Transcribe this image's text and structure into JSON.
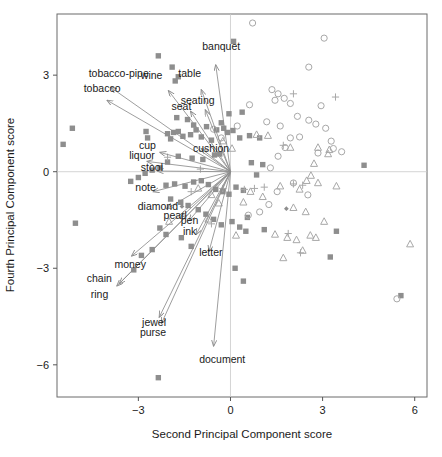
{
  "chart_data": {
    "type": "scatter",
    "title": "",
    "subtitle": "",
    "xlabel": "Second Principal Component score",
    "ylabel": "Fourth Principal Component score",
    "xlim": [
      -5.65,
      6.4
    ],
    "ylim": [
      -7.0,
      4.9
    ],
    "xticks": [
      -3,
      0,
      3,
      6
    ],
    "xticklabels": [
      "−3",
      "0",
      "3",
      "6"
    ],
    "yticks": [
      3,
      0,
      -3,
      -6
    ],
    "yticklabels": [
      "3",
      "0",
      "−3",
      "−6"
    ],
    "grid": false,
    "reference_lines": {
      "vertical_x": 0,
      "horizontal_y": 0,
      "color": "#c9c9c9"
    },
    "legend": {
      "visible": false,
      "position": "none"
    },
    "colors": {
      "square_fill": "#8e8e8e",
      "circle_stroke": "#a8a8a8",
      "triangle_stroke": "#a8a8a8",
      "plus_stroke": "#a8a8a8",
      "arrow": "#8c8c8c",
      "axis": "#555555",
      "text": "#1a1a1a",
      "frame": "#6b6b6b"
    },
    "marker_groups": [
      {
        "name": "filled-square",
        "symbol": "square",
        "filled": true,
        "points": [
          [
            -2.35,
            3.6
          ],
          [
            -1.9,
            3.25
          ],
          [
            -1.7,
            2.95
          ],
          [
            -1.8,
            2.82
          ],
          [
            -5.15,
            1.35
          ],
          [
            -5.45,
            0.85
          ],
          [
            -2.75,
            1.25
          ],
          [
            -2.7,
            1.05
          ],
          [
            -2.05,
            1.18
          ],
          [
            -1.85,
            1.22
          ],
          [
            -1.7,
            1.25
          ],
          [
            -1.95,
            1.02
          ],
          [
            -1.55,
            1.1
          ],
          [
            -1.3,
            1.15
          ],
          [
            -1.12,
            1.3
          ],
          [
            -0.95,
            1.08
          ],
          [
            -1.75,
            1.68
          ],
          [
            -1.4,
            1.62
          ],
          [
            -1.2,
            1.45
          ],
          [
            -0.78,
            1.4
          ],
          [
            -0.45,
            1.3
          ],
          [
            -0.3,
            1.52
          ],
          [
            -0.22,
            1.35
          ],
          [
            -0.1,
            1.22
          ],
          [
            0.08,
            1.28
          ],
          [
            0.3,
            1.05
          ],
          [
            0.62,
            1.12
          ],
          [
            0.95,
            1.05
          ],
          [
            -0.05,
            1.8
          ],
          [
            0.38,
            1.85
          ],
          [
            0.1,
            4.05
          ],
          [
            -0.52,
            0.52
          ],
          [
            -0.35,
            0.55
          ],
          [
            -0.9,
            0.38
          ],
          [
            -1.25,
            0.42
          ],
          [
            -1.7,
            0.48
          ],
          [
            -2.05,
            0.3
          ],
          [
            -2.3,
            0.12
          ],
          [
            -2.55,
            0.05
          ],
          [
            -2.78,
            -0.05
          ],
          [
            -3.0,
            -0.18
          ],
          [
            -3.25,
            -0.3
          ],
          [
            -2.1,
            -0.42
          ],
          [
            -1.82,
            -0.38
          ],
          [
            -1.48,
            -0.45
          ],
          [
            -1.2,
            -0.32
          ],
          [
            -0.95,
            -0.28
          ],
          [
            -0.72,
            -0.4
          ],
          [
            -0.48,
            -0.55
          ],
          [
            -0.25,
            -0.62
          ],
          [
            -0.05,
            -0.7
          ],
          [
            0.18,
            -0.48
          ],
          [
            0.42,
            -0.58
          ],
          [
            0.68,
            0.28
          ],
          [
            1.05,
            0.22
          ],
          [
            0.85,
            -0.1
          ],
          [
            -1.95,
            -0.85
          ],
          [
            -1.62,
            -0.95
          ],
          [
            -1.38,
            -1.05
          ],
          [
            -1.05,
            -1.18
          ],
          [
            -0.8,
            -1.32
          ],
          [
            -0.55,
            -1.48
          ],
          [
            -0.3,
            -1.65
          ],
          [
            0.05,
            -1.55
          ],
          [
            0.3,
            -1.72
          ],
          [
            0.55,
            -1.42
          ],
          [
            -2.3,
            -1.75
          ],
          [
            -2.1,
            -1.95
          ],
          [
            -1.6,
            -2.05
          ],
          [
            -1.28,
            -2.32
          ],
          [
            -2.55,
            -2.42
          ],
          [
            -2.9,
            -2.6
          ],
          [
            -3.15,
            -3.05
          ],
          [
            0.5,
            -1.85
          ],
          [
            1.1,
            -1.8
          ],
          [
            0.15,
            -3.0
          ],
          [
            0.42,
            -3.4
          ],
          [
            -5.05,
            -1.6
          ],
          [
            -2.35,
            -6.4
          ],
          [
            3.45,
            -1.85
          ],
          [
            3.25,
            -2.65
          ],
          [
            5.55,
            -3.85
          ],
          [
            4.35,
            0.2
          ],
          [
            -0.62,
            0.98
          ]
        ]
      },
      {
        "name": "open-circle",
        "symbol": "circle",
        "filled": false,
        "points": [
          [
            0.72,
            4.62
          ],
          [
            3.05,
            4.15
          ],
          [
            2.55,
            3.25
          ],
          [
            1.35,
            2.55
          ],
          [
            1.55,
            2.42
          ],
          [
            1.45,
            2.22
          ],
          [
            1.75,
            2.28
          ],
          [
            1.95,
            2.12
          ],
          [
            0.62,
            2.08
          ],
          [
            2.95,
            2.05
          ],
          [
            2.18,
            1.72
          ],
          [
            2.55,
            1.6
          ],
          [
            1.18,
            1.55
          ],
          [
            1.62,
            1.42
          ],
          [
            2.78,
            1.48
          ],
          [
            3.1,
            1.35
          ],
          [
            0.22,
            1.42
          ],
          [
            1.95,
            1.05
          ],
          [
            2.25,
            1.08
          ],
          [
            3.35,
            0.72
          ],
          [
            3.62,
            0.62
          ],
          [
            2.85,
            0.58
          ],
          [
            1.55,
            0.48
          ],
          [
            1.3,
            0.12
          ],
          [
            2.05,
            -0.35
          ],
          [
            1.52,
            -0.62
          ],
          [
            2.52,
            -0.72
          ],
          [
            1.25,
            -1.02
          ],
          [
            0.95,
            -1.25
          ],
          [
            0.58,
            -1.35
          ],
          [
            -0.55,
            1.32
          ],
          [
            -0.3,
            1.05
          ],
          [
            5.42,
            -3.95
          ],
          [
            3.28,
            0.95
          ],
          [
            1.78,
            0.75
          ]
        ]
      },
      {
        "name": "open-triangle",
        "symbol": "triangle",
        "filled": false,
        "points": [
          [
            0.85,
            1.15
          ],
          [
            1.22,
            1.12
          ],
          [
            1.95,
            0.75
          ],
          [
            2.85,
            0.75
          ],
          [
            3.22,
            0.68
          ],
          [
            3.18,
            0.55
          ],
          [
            2.72,
            0.25
          ],
          [
            2.62,
            -0.12
          ],
          [
            2.48,
            -0.28
          ],
          [
            2.85,
            -0.35
          ],
          [
            3.45,
            -0.45
          ],
          [
            2.25,
            -0.55
          ],
          [
            1.62,
            -0.45
          ],
          [
            0.65,
            -0.62
          ],
          [
            1.05,
            -0.78
          ],
          [
            0.42,
            -0.95
          ],
          [
            2.05,
            -1.12
          ],
          [
            2.45,
            -1.25
          ],
          [
            1.45,
            -1.95
          ],
          [
            1.85,
            -2.05
          ],
          [
            2.15,
            -2.12
          ],
          [
            2.6,
            -1.98
          ],
          [
            2.78,
            -2.05
          ],
          [
            2.35,
            -2.45
          ],
          [
            1.72,
            -2.68
          ],
          [
            5.85,
            -2.25
          ],
          [
            -1.05,
            -0.52
          ],
          [
            -0.62,
            -0.72
          ],
          [
            -0.38,
            -0.98
          ],
          [
            -0.72,
            -1.48
          ],
          [
            0.18,
            -1.98
          ],
          [
            -0.25,
            0.95
          ],
          [
            0.05,
            0.72
          ],
          [
            -2.0,
            -1.55
          ],
          [
            3.05,
            -1.55
          ]
        ]
      },
      {
        "name": "plus",
        "symbol": "plus",
        "filled": false,
        "points": [
          [
            2.05,
            2.42
          ],
          [
            3.42,
            2.32
          ],
          [
            1.72,
            0.82
          ],
          [
            2.05,
            -0.38
          ],
          [
            2.35,
            -0.42
          ],
          [
            1.1,
            -0.48
          ],
          [
            0.78,
            -0.52
          ],
          [
            -0.25,
            -0.52
          ],
          [
            1.88,
            -1.92
          ],
          [
            -2.05,
            0.45
          ],
          [
            -0.98,
            0.08
          ],
          [
            -0.62,
            -1.62
          ],
          [
            -1.28,
            -0.62
          ],
          [
            0.45,
            -0.55
          ],
          [
            2.28,
            -2.52
          ]
        ]
      },
      {
        "name": "small-diamond",
        "symbol": "diamond",
        "filled": true,
        "points": [
          [
            1.82,
            -1.15
          ],
          [
            -1.58,
            -1.08
          ]
        ]
      }
    ],
    "vectors": [
      {
        "label": "tobacco-pipe",
        "tip_x": -3.9,
        "tip_y": 2.62,
        "label_x": -4.62,
        "label_y": 2.95,
        "anchor": "start"
      },
      {
        "label": "tobacco",
        "tip_x": -4.02,
        "tip_y": 2.22,
        "label_x": -4.78,
        "label_y": 2.48,
        "anchor": "start"
      },
      {
        "label": "wine",
        "tip_x": -2.02,
        "tip_y": 2.52,
        "label_x": -2.92,
        "label_y": 2.88,
        "anchor": "start"
      },
      {
        "label": "table",
        "tip_x": -0.95,
        "tip_y": 2.55,
        "label_x": -1.7,
        "label_y": 2.95,
        "anchor": "start"
      },
      {
        "label": "seating",
        "tip_x": -0.82,
        "tip_y": 1.92,
        "label_x": -1.62,
        "label_y": 2.1,
        "anchor": "start"
      },
      {
        "label": "seat",
        "tip_x": -1.3,
        "tip_y": 1.88,
        "label_x": -1.92,
        "label_y": 1.92,
        "anchor": "start"
      },
      {
        "label": "cushion",
        "tip_x": -0.95,
        "tip_y": 0.72,
        "label_x": -1.22,
        "label_y": 0.62,
        "anchor": "start"
      },
      {
        "label": "cup",
        "tip_x": -2.3,
        "tip_y": 0.6,
        "label_x": -2.98,
        "label_y": 0.72,
        "anchor": "start"
      },
      {
        "label": "liquor",
        "tip_x": -2.72,
        "tip_y": 0.32,
        "label_x": -3.3,
        "label_y": 0.4,
        "anchor": "start"
      },
      {
        "label": "stool",
        "tip_x": -2.38,
        "tip_y": 0.02,
        "label_x": -2.92,
        "label_y": 0.02,
        "anchor": "start"
      },
      {
        "label": "note",
        "tip_x": -2.52,
        "tip_y": -0.62,
        "label_x": -3.1,
        "label_y": -0.6,
        "anchor": "start"
      },
      {
        "label": "diamond",
        "tip_x": -2.08,
        "tip_y": -1.15,
        "label_x": -3.02,
        "label_y": -1.18,
        "anchor": "start"
      },
      {
        "label": "pearl",
        "tip_x": -1.62,
        "tip_y": -1.42,
        "label_x": -2.18,
        "label_y": -1.48,
        "anchor": "start"
      },
      {
        "label": "pen",
        "tip_x": -1.35,
        "tip_y": -1.52,
        "label_x": -1.62,
        "label_y": -1.62,
        "anchor": "start"
      },
      {
        "label": "ink",
        "tip_x": -1.12,
        "tip_y": -1.95,
        "label_x": -1.55,
        "label_y": -1.98,
        "anchor": "start"
      },
      {
        "label": "letter",
        "tip_x": -0.7,
        "tip_y": -2.48,
        "label_x": -1.02,
        "label_y": -2.62,
        "anchor": "start"
      },
      {
        "label": "money",
        "tip_x": -3.22,
        "tip_y": -2.62,
        "label_x": -3.78,
        "label_y": -2.98,
        "anchor": "start"
      },
      {
        "label": "chain",
        "tip_x": -3.62,
        "tip_y": -3.48,
        "label_x": -4.68,
        "label_y": -3.42,
        "anchor": "start"
      },
      {
        "label": "ring",
        "tip_x": -3.7,
        "tip_y": -3.55,
        "label_x": -4.55,
        "label_y": -3.92,
        "anchor": "start"
      },
      {
        "label": "jewel",
        "tip_x": -2.32,
        "tip_y": -4.52,
        "label_x": -2.88,
        "label_y": -4.78,
        "anchor": "start"
      },
      {
        "label": "purse",
        "tip_x": -2.25,
        "tip_y": -4.72,
        "label_x": -2.95,
        "label_y": -5.12,
        "anchor": "start"
      },
      {
        "label": "banquet",
        "tip_x": -0.48,
        "tip_y": 3.32,
        "label_x": -0.92,
        "label_y": 3.78,
        "anchor": "start"
      },
      {
        "label": "document",
        "tip_x": -0.55,
        "tip_y": -5.42,
        "label_x": -1.02,
        "label_y": -5.95,
        "anchor": "start"
      }
    ]
  }
}
